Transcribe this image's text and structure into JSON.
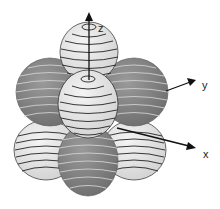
{
  "diagram": {
    "type": "orbital-lobes",
    "axes": {
      "z_label": "z",
      "y_label": "y",
      "x_label": "x"
    },
    "colors": {
      "light_lobe": "#e6e6e6",
      "dark_lobe": "#8a8a8a",
      "stripe_light": "#222222",
      "stripe_dark": "#cfcfcf",
      "axis": "#111111"
    },
    "lobes": [
      {
        "name": "top-back",
        "shade": "light"
      },
      {
        "name": "upper-left",
        "shade": "dark"
      },
      {
        "name": "upper-right",
        "shade": "dark"
      },
      {
        "name": "upper-front",
        "shade": "light"
      },
      {
        "name": "lower-left",
        "shade": "light"
      },
      {
        "name": "lower-right",
        "shade": "light"
      },
      {
        "name": "lower-front",
        "shade": "dark"
      }
    ]
  }
}
